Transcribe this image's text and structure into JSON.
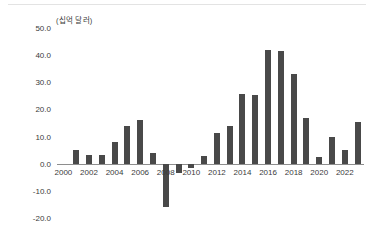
{
  "figure": {
    "unit_label": "(십억 달러)",
    "background_color": "#ffffff",
    "bar_color": "#494949",
    "axis_color": "#8e8e8e",
    "text_color": "#3b3b3b"
  },
  "chart_data": {
    "type": "bar",
    "title": "",
    "subtitle": "",
    "xlabel": "",
    "ylabel": "(십억 달러)",
    "unit": "십억 달러",
    "grid": false,
    "legend": null,
    "ylim": [
      -20.0,
      50.0
    ],
    "ytick_labels": [
      "50.0",
      "40.0",
      "30.0",
      "20.0",
      "10.0",
      "0.0",
      "-10.0",
      "-20.0"
    ],
    "ytick_values": [
      50.0,
      40.0,
      30.0,
      20.0,
      10.0,
      0.0,
      -10.0,
      -20.0
    ],
    "xtick_labels": [
      "2000",
      "2002",
      "2004",
      "2006",
      "2008",
      "2010",
      "2012",
      "2014",
      "2016",
      "2018",
      "2020",
      "2022"
    ],
    "xtick_values": [
      2000,
      2002,
      2004,
      2006,
      2008,
      2010,
      2012,
      2014,
      2016,
      2018,
      2020,
      2022
    ],
    "categories": [
      "2000",
      "2001",
      "2002",
      "2003",
      "2004",
      "2005",
      "2006",
      "2007",
      "2008",
      "2009",
      "2010",
      "2011",
      "2012",
      "2013",
      "2014",
      "2015",
      "2016",
      "2017",
      "2018",
      "2019",
      "2020",
      "2021",
      "2022",
      "2023"
    ],
    "values": [
      0.0,
      5.0,
      3.3,
      3.3,
      8.0,
      13.8,
      16.0,
      3.8,
      -16.0,
      -3.5,
      -1.5,
      3.0,
      11.3,
      13.8,
      25.7,
      25.4,
      42.0,
      41.5,
      33.0,
      17.0,
      2.3,
      9.8,
      5.0,
      15.5
    ]
  }
}
